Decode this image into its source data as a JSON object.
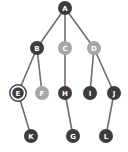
{
  "diagram": {
    "type": "tree",
    "colors": {
      "dark": "#3c3c3c",
      "light": "#a6a6a6",
      "edge": "#6e6e6e",
      "selected_ring": "#3c3c3c"
    },
    "nodes": [
      {
        "id": "A",
        "label": "A",
        "x": 65,
        "y": 8,
        "style": "dark"
      },
      {
        "id": "B",
        "label": "B",
        "x": 37,
        "y": 48,
        "style": "dark"
      },
      {
        "id": "C",
        "label": "C",
        "x": 65,
        "y": 48,
        "style": "light"
      },
      {
        "id": "D",
        "label": "D",
        "x": 94,
        "y": 48,
        "style": "light"
      },
      {
        "id": "E",
        "label": "E",
        "x": 18,
        "y": 93,
        "style": "dark",
        "selected": true
      },
      {
        "id": "F",
        "label": "F",
        "x": 42,
        "y": 93,
        "style": "light"
      },
      {
        "id": "H",
        "label": "H",
        "x": 65,
        "y": 93,
        "style": "dark"
      },
      {
        "id": "I",
        "label": "I",
        "x": 90,
        "y": 93,
        "style": "dark"
      },
      {
        "id": "J",
        "label": "J",
        "x": 114,
        "y": 93,
        "style": "dark"
      },
      {
        "id": "K",
        "label": "K",
        "x": 31,
        "y": 136,
        "style": "dark"
      },
      {
        "id": "G",
        "label": "G",
        "x": 73,
        "y": 136,
        "style": "dark"
      },
      {
        "id": "L",
        "label": "L",
        "x": 106,
        "y": 136,
        "style": "dark"
      }
    ],
    "edges": [
      [
        "A",
        "B"
      ],
      [
        "A",
        "C"
      ],
      [
        "A",
        "D"
      ],
      [
        "B",
        "E"
      ],
      [
        "B",
        "F"
      ],
      [
        "C",
        "H"
      ],
      [
        "D",
        "I"
      ],
      [
        "D",
        "J"
      ],
      [
        "E",
        "K"
      ],
      [
        "H",
        "G"
      ],
      [
        "J",
        "L"
      ]
    ]
  }
}
